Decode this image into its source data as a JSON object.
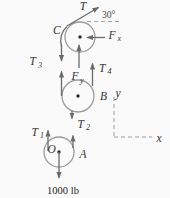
{
  "figure": {
    "type": "pulley-free-body-diagram",
    "load": "1000 lb",
    "angle": "30°",
    "labels": {
      "T": "T",
      "C": "C",
      "B": "B",
      "O": "O",
      "A": "A",
      "x": "x",
      "y": "y"
    },
    "tensions": {
      "T1": {
        "base": "T",
        "sub": "1"
      },
      "T2": {
        "base": "T",
        "sub": "2"
      },
      "T3": {
        "base": "T",
        "sub": "3"
      },
      "T4": {
        "base": "T",
        "sub": "4"
      }
    },
    "reactions": {
      "Fx": {
        "base": "F",
        "sub": "x"
      },
      "Fy": {
        "base": "F",
        "sub": "y"
      }
    },
    "colors": {
      "arrow": "#6a6a6a",
      "pulley_outline": "#9a9a9a",
      "text": "#333333",
      "dashed_line": "#a0a0a0",
      "background": "#fafafa"
    }
  }
}
